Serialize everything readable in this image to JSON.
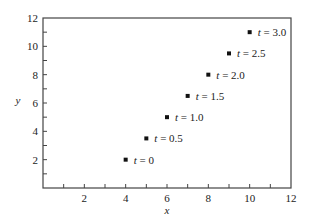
{
  "chart_data": {
    "type": "scatter",
    "title": "",
    "xlabel": "x",
    "ylabel": "y",
    "xlim": [
      0,
      12
    ],
    "ylim": [
      0,
      12
    ],
    "x_ticks": [
      1,
      2,
      3,
      4,
      5,
      6,
      7,
      8,
      9,
      10,
      11,
      12
    ],
    "x_tick_labels": [
      "2",
      "4",
      "6",
      "8",
      "10",
      "12"
    ],
    "y_ticks": [
      1,
      2,
      3,
      4,
      5,
      6,
      7,
      8,
      9,
      10,
      11,
      12
    ],
    "y_tick_labels": [
      "2",
      "4",
      "6",
      "8",
      "10",
      "12"
    ],
    "grid": false,
    "legend": null,
    "series": [
      {
        "name": "position at time t",
        "marker": "square",
        "color": "#111111",
        "points": [
          {
            "t": 0,
            "x": 4,
            "y": 2,
            "label": "t = 0"
          },
          {
            "t": 0.5,
            "x": 5,
            "y": 3.5,
            "label": "t = 0.5"
          },
          {
            "t": 1.0,
            "x": 6,
            "y": 5,
            "label": "t = 1.0"
          },
          {
            "t": 1.5,
            "x": 7,
            "y": 6.5,
            "label": "t = 1.5"
          },
          {
            "t": 2.0,
            "x": 8,
            "y": 8,
            "label": "t = 2.0"
          },
          {
            "t": 2.5,
            "x": 9,
            "y": 9.5,
            "label": "t = 2.5"
          },
          {
            "t": 3.0,
            "x": 10,
            "y": 11,
            "label": "t = 3.0"
          }
        ]
      }
    ],
    "annotations": [
      "t = 0",
      "t = 0.5",
      "t = 1.0",
      "t = 1.5",
      "t = 2.0",
      "t = 2.5",
      "t = 3.0"
    ]
  },
  "style": {
    "axis_color": "#444444",
    "point_color": "#111111",
    "text_color": "#222222"
  }
}
